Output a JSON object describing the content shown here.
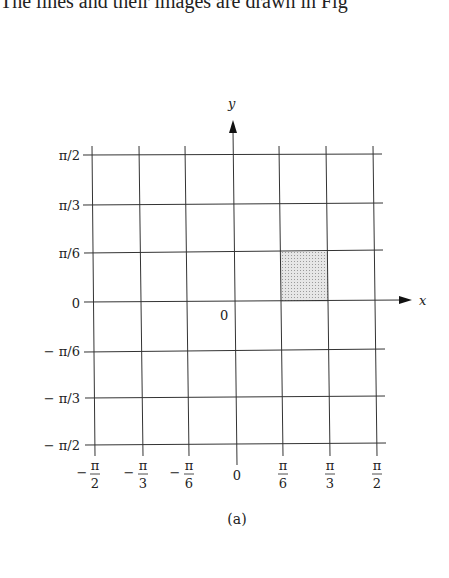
{
  "header": {
    "partial_text": "The lines and their images are drawn in Fig"
  },
  "figure": {
    "caption": "(a)",
    "axes": {
      "x_label": "x",
      "y_label": "y",
      "origin_label": "0"
    },
    "y_ticks": [
      "π/2",
      "π/3",
      "π/6",
      "0",
      "− π/6",
      "− π/3",
      "− π/2"
    ],
    "x_ticks": [
      {
        "sign": "−",
        "num": "π",
        "den": "2"
      },
      {
        "sign": "−",
        "num": "π",
        "den": "3"
      },
      {
        "sign": "−",
        "num": "π",
        "den": "6"
      },
      {
        "sign": "",
        "num": "0",
        "den": ""
      },
      {
        "sign": "",
        "num": "π",
        "den": "6"
      },
      {
        "sign": "",
        "num": "π",
        "den": "3"
      },
      {
        "sign": "",
        "num": "π",
        "den": "2"
      }
    ],
    "shaded_region": {
      "x_from": "π/6",
      "x_to": "π/3",
      "y_from": "0",
      "y_to": "π/6",
      "fill": "#d9d9d9"
    },
    "colors": {
      "line": "#333333",
      "shade": "#d9d9d9"
    }
  }
}
